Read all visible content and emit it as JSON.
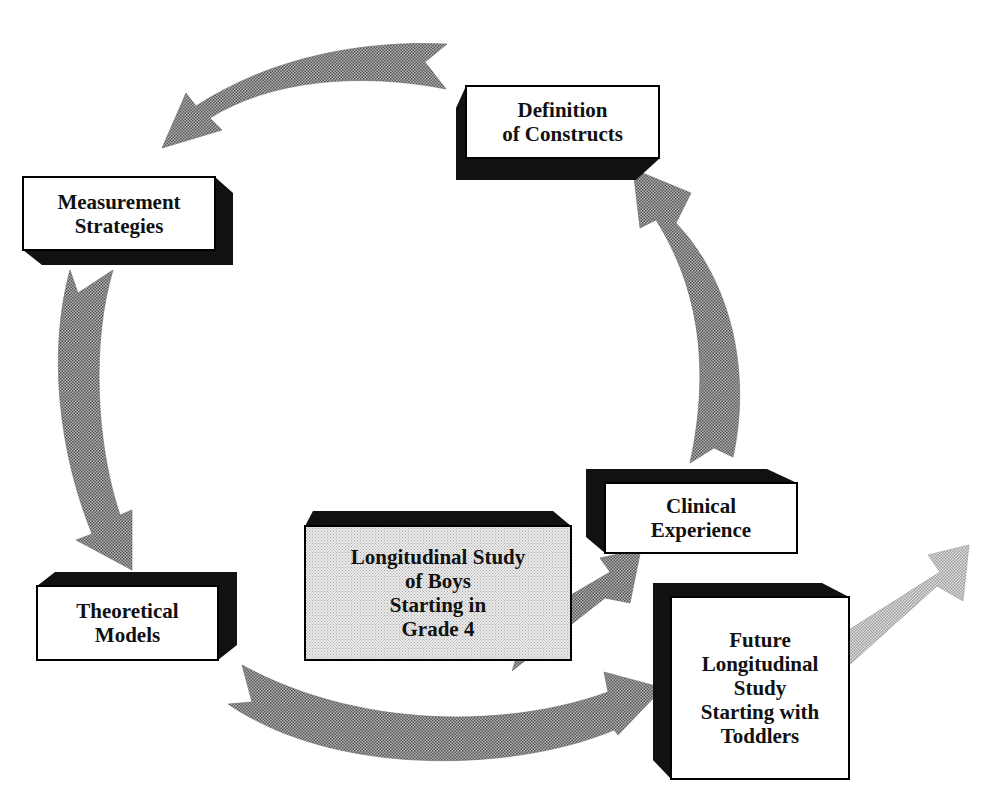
{
  "title": {
    "text": "Cropped title text (partially visible)",
    "visible": "partial"
  },
  "colors": {
    "box_border": "#000000",
    "box_face": "#ffffff",
    "box_depth": "#111111",
    "highlight_face": "#d8d8d8",
    "arrow_fill": "#8a8a8a",
    "arrow_light_fill": "#c2c2c2"
  },
  "nodes": {
    "definition": {
      "label": "Definition\nof Constructs"
    },
    "measurement": {
      "label": "Measurement\nStrategies"
    },
    "theoretical": {
      "label": "Theoretical\nModels"
    },
    "longitudinal_boys": {
      "label": "Longitudinal Study\nof Boys\nStarting in\nGrade 4"
    },
    "clinical": {
      "label": "Clinical\nExperience"
    },
    "future": {
      "label": "Future\nLongitudinal\nStudy\nStarting with\nToddlers"
    }
  },
  "edges": [
    {
      "from": "Definition of Constructs",
      "to": "Measurement Strategies"
    },
    {
      "from": "Measurement Strategies",
      "to": "Theoretical Models"
    },
    {
      "from": "Theoretical Models",
      "to": "Future Longitudinal Study Starting with Toddlers"
    },
    {
      "from": "Clinical Experience",
      "to": "Definition of Constructs"
    },
    {
      "from": "Longitudinal Study of Boys Starting in Grade 4",
      "to": "Clinical Experience"
    },
    {
      "from": "Future Longitudinal Study Starting with Toddlers",
      "to": "(beyond)"
    }
  ]
}
